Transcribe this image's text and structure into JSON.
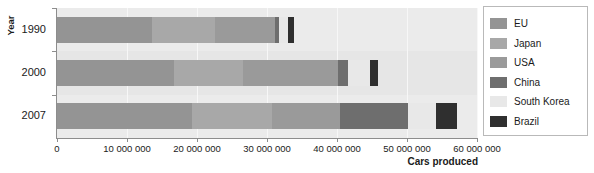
{
  "chart_data": {
    "type": "bar",
    "orientation": "horizontal",
    "stacked": true,
    "title": "",
    "xlabel": "Cars produced",
    "ylabel": "Year",
    "categories": [
      "1990",
      "2000",
      "2007"
    ],
    "xlim": [
      0,
      60000000
    ],
    "xticks": [
      0,
      10000000,
      20000000,
      30000000,
      40000000,
      50000000,
      60000000
    ],
    "xtick_labels": [
      "0",
      "10 000 000",
      "20 000 000",
      "30 000 000",
      "40 000 000",
      "50 000 000",
      "60 000 000"
    ],
    "grid": true,
    "legend_position": "right",
    "series": [
      {
        "name": "EU",
        "color": "#949494",
        "values": [
          13600000,
          16700000,
          19300000
        ]
      },
      {
        "name": "Japan",
        "color": "#a8a8a8",
        "values": [
          9000000,
          9900000,
          11400000
        ]
      },
      {
        "name": "USA",
        "color": "#9a9a9a",
        "values": [
          8600000,
          13600000,
          9700000
        ]
      },
      {
        "name": "China",
        "color": "#6e6e6e",
        "values": [
          470000,
          1400000,
          9700000
        ]
      },
      {
        "name": "South Korea",
        "color": "#e8e8e8",
        "values": [
          1320000,
          3100000,
          4100000
        ]
      },
      {
        "name": "Brazil",
        "color": "#2f2f2f",
        "values": [
          910000,
          1200000,
          3000000
        ]
      }
    ]
  },
  "legend": {
    "items": [
      {
        "label": "EU"
      },
      {
        "label": "Japan"
      },
      {
        "label": "USA"
      },
      {
        "label": "China"
      },
      {
        "label": "South Korea"
      },
      {
        "label": "Brazil"
      }
    ]
  }
}
